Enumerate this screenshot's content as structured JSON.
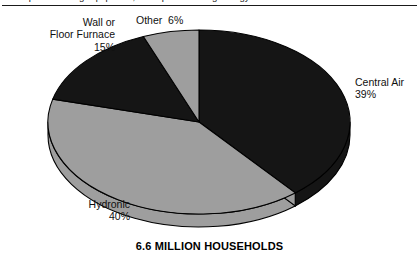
{
  "header": {
    "clipped_text": "space heating equipment, and space heating energy",
    "rule": "horizontal-rule"
  },
  "caption": "6.6 MILLION HOUSEHOLDS",
  "labels": {
    "wall_furnace": "Wall or\nFloor Furnace\n15%",
    "other": "Other  6%",
    "central_air": "Central Air\n39%",
    "hydronic": "Hydronic\n40%"
  },
  "colors": {
    "dark_slice": "#151515",
    "light_slice": "#9e9e9e",
    "outline": "#000000",
    "background": "#ffffff"
  },
  "chart_data": {
    "type": "pie",
    "title": "",
    "subtitle": "6.6 MILLION HOUSEHOLDS",
    "labels": [
      "Central Air",
      "Hydronic",
      "Wall or Floor Furnace",
      "Other"
    ],
    "values": [
      39,
      40,
      15,
      6
    ],
    "unit": "%",
    "total_label": "6.6 MILLION HOUSEHOLDS",
    "slice_colors": [
      "#151515",
      "#9e9e9e",
      "#151515",
      "#9e9e9e"
    ],
    "legend": "none",
    "grid": false,
    "style": "3d-exploded-none",
    "start_angle_deg": 0,
    "direction": "clockwise",
    "annotations": [
      {
        "label": "Central Air",
        "value": 39,
        "text": "Central Air 39%",
        "position": "right"
      },
      {
        "label": "Hydronic",
        "value": 40,
        "text": "Hydronic 40%",
        "position": "bottom-left"
      },
      {
        "label": "Wall or Floor Furnace",
        "value": 15,
        "text": "Wall or Floor Furnace 15%",
        "position": "top-left"
      },
      {
        "label": "Other",
        "value": 6,
        "text": "Other 6%",
        "position": "top"
      }
    ]
  }
}
